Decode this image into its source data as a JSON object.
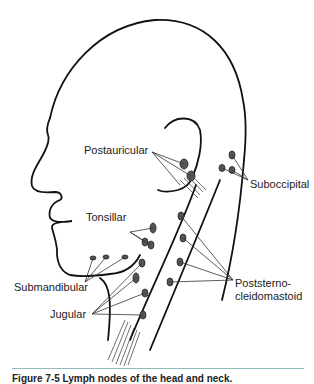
{
  "figure": {
    "labels": {
      "postauricular": "Postauricular",
      "suboccipital": "Suboccipital",
      "tonsillar": "Tonsillar",
      "submandibular": "Submandibular",
      "jugular": "Jugular",
      "poststerno_line1": "Poststerno-",
      "poststerno_line2": "cleidomastoid"
    },
    "caption": "Figure 7-5  Lymph nodes of the head and neck.",
    "rule_color": "#8fbcbc"
  }
}
